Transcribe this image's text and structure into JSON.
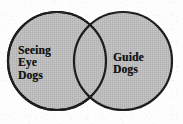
{
  "diagram": {
    "type": "venn",
    "title": "",
    "canvas": {
      "width": 183,
      "height": 124
    },
    "style": {
      "fill_color": "#b8b8b8",
      "stroke_color": "#151515",
      "background_color": "#fdfdfd",
      "text_color": "#111111",
      "stroke_width": 2.2
    },
    "sets": [
      {
        "id": "left",
        "label": "Seeing Eye Dogs",
        "label_lines": [
          "Seeing",
          "Eye",
          "Dogs"
        ],
        "center_x": 57,
        "center_y": 61,
        "radius": 49
      },
      {
        "id": "right",
        "label": "Guide Dogs",
        "label_lines": [
          "Guide",
          "Dogs"
        ],
        "center_x": 123,
        "center_y": 61,
        "radius": 49
      }
    ],
    "intersection": {
      "label": "",
      "shaded": true,
      "crossing_points": [
        {
          "x": 90,
          "y": 15
        },
        {
          "x": 90,
          "y": 107
        }
      ]
    }
  }
}
